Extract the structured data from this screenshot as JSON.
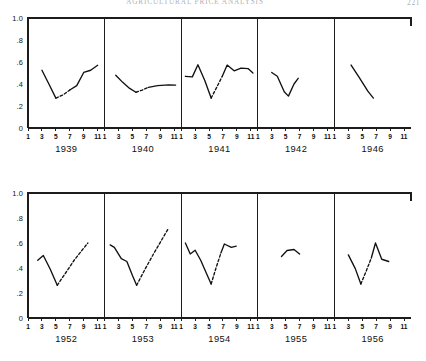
{
  "page": {
    "running_head": "Agricultural Price Analysis",
    "folio": "221"
  },
  "axes": {
    "y_tick_labels": [
      "1.0",
      ".8",
      ".6",
      ".4",
      ".2",
      "0"
    ],
    "y_tick_values": [
      1.0,
      0.8,
      0.6,
      0.4,
      0.2,
      0.0
    ],
    "y_min": 0.0,
    "y_max": 1.0,
    "x_tick_labels": [
      "1",
      "3",
      "5",
      "7",
      "9",
      "11"
    ],
    "x_tick_values": [
      1,
      3,
      5,
      7,
      9,
      11
    ],
    "x_min": 1,
    "x_max": 12
  },
  "chart_data": {
    "type": "line",
    "title": "Agricultural Price Analysis",
    "xlabel": "",
    "ylabel": "",
    "ylim": [
      0,
      1.0
    ],
    "xlim": [
      1,
      12
    ],
    "grid": false,
    "legend": "none",
    "layout": "small-multiples 2 rows x 5 panels",
    "note": "Dashed segments indicate interpolated or estimated intervals.",
    "rows": [
      {
        "row_index": 0,
        "panels": [
          {
            "year": "1939",
            "segments": [
              {
                "style": "solid",
                "points": [
                  [
                    3.0,
                    0.525
                  ],
                  [
                    4.0,
                    0.4
                  ],
                  [
                    5.0,
                    0.272
                  ]
                ]
              },
              {
                "style": "dashed",
                "points": [
                  [
                    5.0,
                    0.272
                  ],
                  [
                    6.0,
                    0.3
                  ],
                  [
                    7.0,
                    0.345
                  ]
                ]
              },
              {
                "style": "solid",
                "points": [
                  [
                    7.0,
                    0.345
                  ],
                  [
                    8.0,
                    0.385
                  ],
                  [
                    9.0,
                    0.505
                  ],
                  [
                    10.0,
                    0.525
                  ],
                  [
                    11.0,
                    0.57
                  ]
                ]
              }
            ]
          },
          {
            "year": "1940",
            "segments": [
              {
                "style": "solid",
                "points": [
                  [
                    2.6,
                    0.48
                  ],
                  [
                    3.6,
                    0.415
                  ],
                  [
                    4.6,
                    0.36
                  ],
                  [
                    5.5,
                    0.325
                  ]
                ]
              },
              {
                "style": "dashed",
                "points": [
                  [
                    5.5,
                    0.325
                  ],
                  [
                    6.4,
                    0.345
                  ],
                  [
                    7.3,
                    0.37
                  ]
                ]
              },
              {
                "style": "solid",
                "points": [
                  [
                    7.3,
                    0.37
                  ],
                  [
                    8.6,
                    0.385
                  ],
                  [
                    10.2,
                    0.392
                  ],
                  [
                    11.2,
                    0.39
                  ]
                ]
              }
            ]
          },
          {
            "year": "1941",
            "segments": [
              {
                "style": "solid",
                "points": [
                  [
                    1.6,
                    0.47
                  ],
                  [
                    2.6,
                    0.465
                  ],
                  [
                    3.4,
                    0.575
                  ],
                  [
                    4.4,
                    0.43
                  ],
                  [
                    5.3,
                    0.272
                  ]
                ]
              },
              {
                "style": "dashed",
                "points": [
                  [
                    5.3,
                    0.272
                  ],
                  [
                    6.1,
                    0.37
                  ],
                  [
                    6.9,
                    0.47
                  ]
                ]
              },
              {
                "style": "solid",
                "points": [
                  [
                    6.9,
                    0.47
                  ],
                  [
                    7.6,
                    0.572
                  ],
                  [
                    8.6,
                    0.52
                  ],
                  [
                    9.6,
                    0.545
                  ],
                  [
                    10.6,
                    0.54
                  ],
                  [
                    11.3,
                    0.5
                  ]
                ]
              }
            ]
          },
          {
            "year": "1942",
            "segments": [
              {
                "style": "solid",
                "points": [
                  [
                    3.0,
                    0.505
                  ],
                  [
                    3.8,
                    0.47
                  ],
                  [
                    4.8,
                    0.33
                  ],
                  [
                    5.4,
                    0.29
                  ],
                  [
                    6.2,
                    0.4
                  ],
                  [
                    6.8,
                    0.452
                  ]
                ]
              }
            ]
          },
          {
            "year": "1946",
            "segments": [
              {
                "style": "solid",
                "points": [
                  [
                    3.4,
                    0.572
                  ],
                  [
                    4.6,
                    0.455
                  ],
                  [
                    5.8,
                    0.335
                  ],
                  [
                    6.6,
                    0.272
                  ]
                ]
              }
            ]
          }
        ]
      },
      {
        "row_index": 1,
        "panels": [
          {
            "year": "1952",
            "segments": [
              {
                "style": "solid",
                "points": [
                  [
                    2.4,
                    0.462
                  ],
                  [
                    3.2,
                    0.5
                  ],
                  [
                    4.2,
                    0.39
                  ],
                  [
                    5.2,
                    0.262
                  ]
                ]
              },
              {
                "style": "dashed",
                "points": [
                  [
                    5.2,
                    0.262
                  ],
                  [
                    6.4,
                    0.36
                  ],
                  [
                    7.6,
                    0.46
                  ],
                  [
                    8.8,
                    0.545
                  ],
                  [
                    9.6,
                    0.6
                  ]
                ]
              }
            ]
          },
          {
            "year": "1953",
            "segments": [
              {
                "style": "solid",
                "points": [
                  [
                    1.8,
                    0.585
                  ],
                  [
                    2.4,
                    0.565
                  ],
                  [
                    3.4,
                    0.475
                  ],
                  [
                    4.2,
                    0.452
                  ],
                  [
                    5.0,
                    0.34
                  ],
                  [
                    5.6,
                    0.262
                  ]
                ]
              },
              {
                "style": "dashed",
                "points": [
                  [
                    5.6,
                    0.262
                  ],
                  [
                    6.8,
                    0.39
                  ],
                  [
                    8.0,
                    0.51
                  ],
                  [
                    9.2,
                    0.625
                  ],
                  [
                    10.2,
                    0.72
                  ]
                ]
              }
            ]
          },
          {
            "year": "1954",
            "segments": [
              {
                "style": "solid",
                "points": [
                  [
                    1.6,
                    0.6
                  ],
                  [
                    2.3,
                    0.512
                  ],
                  [
                    3.0,
                    0.542
                  ],
                  [
                    3.8,
                    0.462
                  ],
                  [
                    4.6,
                    0.36
                  ],
                  [
                    5.3,
                    0.272
                  ]
                ]
              },
              {
                "style": "dashed",
                "points": [
                  [
                    5.3,
                    0.272
                  ],
                  [
                    6.0,
                    0.4
                  ],
                  [
                    6.7,
                    0.52
                  ]
                ]
              },
              {
                "style": "solid",
                "points": [
                  [
                    6.7,
                    0.52
                  ],
                  [
                    7.2,
                    0.592
                  ],
                  [
                    8.2,
                    0.565
                  ],
                  [
                    8.9,
                    0.575
                  ]
                ]
              }
            ]
          },
          {
            "year": "1955",
            "segments": [
              {
                "style": "solid",
                "points": [
                  [
                    4.4,
                    0.492
                  ],
                  [
                    5.2,
                    0.54
                  ],
                  [
                    6.2,
                    0.548
                  ],
                  [
                    7.0,
                    0.512
                  ]
                ]
              }
            ]
          },
          {
            "year": "1956",
            "segments": [
              {
                "style": "solid",
                "points": [
                  [
                    3.0,
                    0.505
                  ],
                  [
                    4.0,
                    0.395
                  ],
                  [
                    4.8,
                    0.272
                  ]
                ]
              },
              {
                "style": "dashed",
                "points": [
                  [
                    4.8,
                    0.272
                  ],
                  [
                    5.6,
                    0.38
                  ],
                  [
                    6.3,
                    0.48
                  ]
                ]
              },
              {
                "style": "solid",
                "points": [
                  [
                    6.3,
                    0.48
                  ],
                  [
                    6.9,
                    0.6
                  ],
                  [
                    7.8,
                    0.47
                  ],
                  [
                    8.8,
                    0.452
                  ]
                ]
              }
            ]
          }
        ]
      }
    ]
  }
}
